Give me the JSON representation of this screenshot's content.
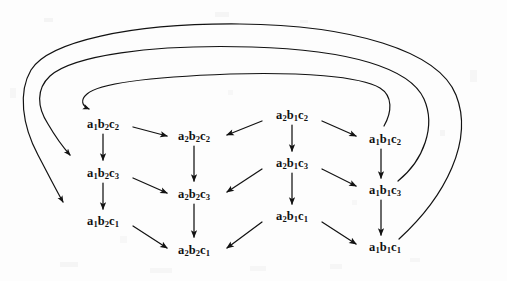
{
  "figure": {
    "kind": "state-transition-diagram",
    "width": 507,
    "height": 281,
    "background_color": "#fdfdfd",
    "ink_color": "#121212"
  },
  "nodes": [
    {
      "id": "a1b2c2",
      "base": "a",
      "sub1": "1",
      "mid": "b",
      "sub2": "2",
      "last": "c",
      "sub3": "2",
      "text": "a1b2c2",
      "col": 0,
      "row": 0,
      "x": 103,
      "y": 124
    },
    {
      "id": "a1b2c3",
      "base": "a",
      "sub1": "1",
      "mid": "b",
      "sub2": "2",
      "last": "c",
      "sub3": "3",
      "text": "a1b2c3",
      "col": 0,
      "row": 1,
      "x": 103,
      "y": 173
    },
    {
      "id": "a1b2c1",
      "base": "a",
      "sub1": "1",
      "mid": "b",
      "sub2": "2",
      "last": "c",
      "sub3": "1",
      "text": "a1b2c1",
      "col": 0,
      "row": 2,
      "x": 103,
      "y": 221
    },
    {
      "id": "a2b2c2",
      "base": "a",
      "sub1": "2",
      "mid": "b",
      "sub2": "2",
      "last": "c",
      "sub3": "2",
      "text": "a2b2c2",
      "col": 1,
      "row": 0,
      "x": 194,
      "y": 136
    },
    {
      "id": "a2b2c3",
      "base": "a",
      "sub1": "2",
      "mid": "b",
      "sub2": "2",
      "last": "c",
      "sub3": "3",
      "text": "a2b2c3",
      "col": 1,
      "row": 1,
      "x": 194,
      "y": 194
    },
    {
      "id": "a2b2c1",
      "base": "a",
      "sub1": "2",
      "mid": "b",
      "sub2": "2",
      "last": "c",
      "sub3": "1",
      "text": "a2b2c1",
      "col": 1,
      "row": 2,
      "x": 194,
      "y": 250
    },
    {
      "id": "a2b1c2",
      "base": "a",
      "sub1": "2",
      "mid": "b",
      "sub2": "1",
      "last": "c",
      "sub3": "2",
      "text": "a2b1c2",
      "col": 2,
      "row": 0,
      "x": 292,
      "y": 115
    },
    {
      "id": "a2b1c3",
      "base": "a",
      "sub1": "2",
      "mid": "b",
      "sub2": "1",
      "last": "c",
      "sub3": "3",
      "text": "a2b1c3",
      "col": 2,
      "row": 1,
      "x": 292,
      "y": 163
    },
    {
      "id": "a2b1c1",
      "base": "a",
      "sub1": "2",
      "mid": "b",
      "sub2": "1",
      "last": "c",
      "sub3": "1",
      "text": "a2b1c1",
      "col": 2,
      "row": 2,
      "x": 292,
      "y": 216
    },
    {
      "id": "a1b1c2",
      "base": "a",
      "sub1": "1",
      "mid": "b",
      "sub2": "1",
      "last": "c",
      "sub3": "2",
      "text": "a1b1c2",
      "col": 3,
      "row": 0,
      "x": 385,
      "y": 139
    },
    {
      "id": "a1b1c3",
      "base": "a",
      "sub1": "1",
      "mid": "b",
      "sub2": "1",
      "last": "c",
      "sub3": "3",
      "text": "a1b1c3",
      "col": 3,
      "row": 1,
      "x": 385,
      "y": 190
    },
    {
      "id": "a1b1c1",
      "base": "a",
      "sub1": "1",
      "mid": "b",
      "sub2": "1",
      "last": "c",
      "sub3": "1",
      "text": "a1b1c1",
      "col": 3,
      "row": 2,
      "x": 385,
      "y": 247
    }
  ],
  "edges": [
    {
      "from": "a1b2c2",
      "to": "a2b2c2",
      "shape": "diagonal-right-down"
    },
    {
      "from": "a1b2c2",
      "to": "a1b2c3",
      "shape": "vertical-down"
    },
    {
      "from": "a1b2c3",
      "to": "a2b2c3",
      "shape": "diagonal-right-down"
    },
    {
      "from": "a1b2c3",
      "to": "a1b2c1",
      "shape": "vertical-down"
    },
    {
      "from": "a1b2c1",
      "to": "a2b2c1",
      "shape": "diagonal-right-down"
    },
    {
      "from": "a2b2c2",
      "to": "a2b2c3",
      "shape": "vertical-down"
    },
    {
      "from": "a2b2c3",
      "to": "a2b2c1",
      "shape": "vertical-down"
    },
    {
      "from": "a2b1c2",
      "to": "a2b2c2",
      "shape": "diagonal-left-down"
    },
    {
      "from": "a2b1c2",
      "to": "a2b1c3",
      "shape": "vertical-down"
    },
    {
      "from": "a2b1c2",
      "to": "a1b1c2",
      "shape": "diagonal-right-down"
    },
    {
      "from": "a2b1c3",
      "to": "a2b2c3",
      "shape": "diagonal-left-down"
    },
    {
      "from": "a2b1c3",
      "to": "a2b1c1",
      "shape": "vertical-down"
    },
    {
      "from": "a2b1c3",
      "to": "a1b1c3",
      "shape": "diagonal-right-down"
    },
    {
      "from": "a2b1c1",
      "to": "a2b2c1",
      "shape": "diagonal-left-down"
    },
    {
      "from": "a2b1c1",
      "to": "a1b1c1",
      "shape": "diagonal-right-down"
    },
    {
      "from": "a1b1c2",
      "to": "a1b1c3",
      "shape": "vertical-down"
    },
    {
      "from": "a1b1c3",
      "to": "a1b1c1",
      "shape": "vertical-down"
    },
    {
      "from": "a1b1c2",
      "to": "a1b2c2",
      "shape": "feedback-arc-inner"
    },
    {
      "from": "a1b1c3",
      "to": "a1b2c3",
      "shape": "feedback-arc-middle"
    },
    {
      "from": "a1b1c1",
      "to": "a1b2c1",
      "shape": "feedback-arc-outer"
    }
  ],
  "legend": {
    "columns": [
      "a1b2",
      "a2b2",
      "a2b1",
      "a1b1"
    ],
    "rows": [
      "c2",
      "c3",
      "c1"
    ]
  }
}
